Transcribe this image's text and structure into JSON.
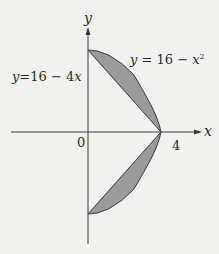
{
  "diagram": {
    "axes": {
      "x_label": "x",
      "y_label": "y",
      "origin_label": "0",
      "x_tick_label": "4"
    },
    "curves": [
      {
        "name": "parabola",
        "label": "y = 16 − x²",
        "equation": "y = 16 - x^2"
      },
      {
        "name": "line",
        "label": "y=16 − 4x",
        "equation": "y = 16 - 4x"
      }
    ],
    "shaded_regions": [
      {
        "name": "upper",
        "between": [
          "y = 16 - x^2",
          "y = 16 - 4x"
        ],
        "x_range": [
          0,
          4
        ]
      },
      {
        "name": "lower",
        "mirror_of": "upper",
        "reflected_across": "x-axis"
      }
    ],
    "colors": {
      "background": "#f1f1ef",
      "shade": "#9a9a9a",
      "stroke": "#3a3a3a",
      "text": "#2a2a2a"
    }
  }
}
